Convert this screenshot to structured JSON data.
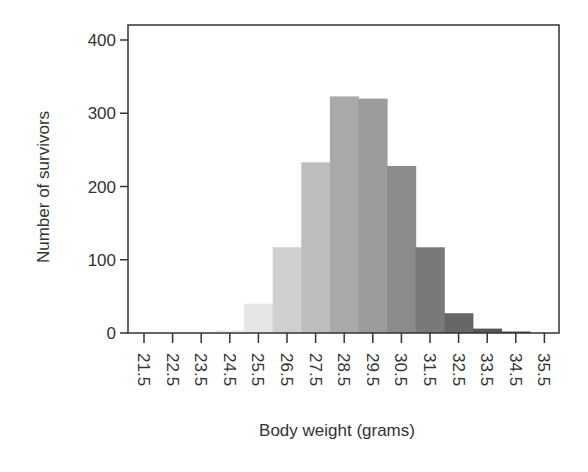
{
  "chart_data": {
    "type": "bar",
    "title": "",
    "xlabel": "Body weight (grams)",
    "ylabel": "Number of survivors",
    "categories": [
      "21.5",
      "22.5",
      "23.5",
      "24.5",
      "25.5",
      "26.5",
      "27.5",
      "28.5",
      "29.5",
      "30.5",
      "31.5",
      "32.5",
      "33.5",
      "34.5",
      "35.5"
    ],
    "values": [
      0,
      0,
      0,
      4,
      40,
      117,
      233,
      323,
      320,
      228,
      117,
      27,
      6,
      2,
      0
    ],
    "colors": [
      "#f4f4f4",
      "#f2f2f2",
      "#f0f0f0",
      "#eeeeee",
      "#e6e6e6",
      "#cfcfcf",
      "#bdbdbd",
      "#a9a9a9",
      "#9b9b9b",
      "#8b8b8b",
      "#797979",
      "#676767",
      "#575757",
      "#474747",
      "#3a3a3a"
    ],
    "ylim": [
      0,
      400
    ],
    "yticks": [
      0,
      100,
      200,
      300,
      400
    ],
    "grid": false,
    "legend": null,
    "xtick_rotation": 90
  },
  "layout": {
    "plot_left": 128,
    "plot_right": 559,
    "plot_top": 25,
    "plot_bottom": 333,
    "x_first_tick": 144,
    "x_tick_spacing": 28.6,
    "y_zero": 333,
    "px_per_unit": 0.7325
  }
}
